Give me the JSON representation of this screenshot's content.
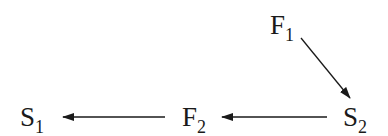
{
  "diagram": {
    "type": "flow",
    "nodes": [
      {
        "id": "F1",
        "base": "F",
        "sub": "1"
      },
      {
        "id": "S2",
        "base": "S",
        "sub": "2"
      },
      {
        "id": "F2",
        "base": "F",
        "sub": "2"
      },
      {
        "id": "S1",
        "base": "S",
        "sub": "1"
      }
    ],
    "edges": [
      {
        "from": "F1",
        "to": "S2"
      },
      {
        "from": "S2",
        "to": "F2"
      },
      {
        "from": "F2",
        "to": "S1"
      }
    ],
    "colors": {
      "stroke": "#1a1a1a",
      "background": "#ffffff"
    }
  }
}
